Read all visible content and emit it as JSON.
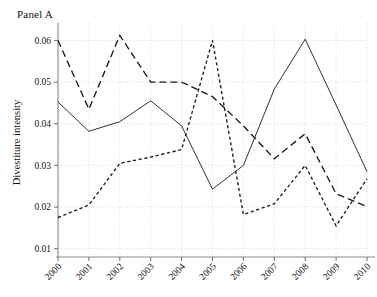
{
  "panel": {
    "title": "Panel A"
  },
  "chart_data": {
    "type": "line",
    "title": "Panel A",
    "xlabel": "",
    "ylabel": "Divestiture intensity",
    "x": [
      "2000",
      "2001",
      "2002",
      "2003",
      "2004",
      "2005",
      "2006",
      "2007",
      "2008",
      "2009",
      "2010"
    ],
    "xtick_labels": [
      "2000",
      "2001",
      "2002",
      "2003",
      "2004",
      "2005",
      "2006",
      "2007",
      "2008",
      "2009",
      "2010"
    ],
    "ytick_labels": [
      "0.01",
      "0.02",
      "0.03",
      "0.04",
      "0.05",
      "0.06"
    ],
    "ytick_values": [
      0.01,
      0.02,
      0.03,
      0.04,
      0.05,
      0.06
    ],
    "ylim": [
      0.0085,
      0.0625
    ],
    "xlim": [
      0,
      10
    ],
    "grid": true,
    "legend": "none",
    "series": [
      {
        "name": "solid-series",
        "style": "solid",
        "color": "#1a1a1a",
        "width": 0.9,
        "dasharray": "",
        "values": [
          0.0452,
          0.0382,
          0.0405,
          0.0455,
          0.0395,
          0.0243,
          0.03,
          0.0483,
          0.0603,
          0.0445,
          0.0285
        ]
      },
      {
        "name": "long-dashed-series",
        "style": "long-dashed",
        "color": "#1a1a1a",
        "width": 1.35,
        "dasharray": "7 4",
        "values": [
          0.06,
          0.0435,
          0.0612,
          0.05,
          0.05,
          0.0465,
          0.0395,
          0.0316,
          0.0376,
          0.0232,
          0.0201
        ]
      },
      {
        "name": "short-dashed-series",
        "style": "short-dashed",
        "color": "#1a1a1a",
        "width": 1.35,
        "dasharray": "3.2 2.6",
        "values": [
          0.0175,
          0.0205,
          0.0305,
          0.032,
          0.0338,
          0.06,
          0.0182,
          0.0208,
          0.03,
          0.0155,
          0.0268
        ]
      }
    ]
  }
}
